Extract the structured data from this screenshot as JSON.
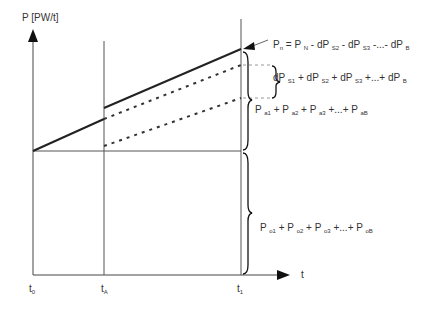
{
  "diagram": {
    "y_axis_label": "P [PW/t]",
    "x_axis_label": "t",
    "x_ticks": [
      {
        "main": "t",
        "sub": "0"
      },
      {
        "main": "t",
        "sub": "A"
      },
      {
        "main": "t",
        "sub": "1"
      }
    ],
    "labels": {
      "pn_formula": {
        "parts": [
          "P",
          "n",
          " = P ",
          "N",
          " - dP ",
          "S2",
          " - dP ",
          "S3",
          " -...- dP ",
          "B"
        ]
      },
      "dp_sum": {
        "parts": [
          "dP ",
          "S1",
          "  +  dP ",
          "S2",
          " + dP ",
          "S3",
          " +...+  dP ",
          "B"
        ]
      },
      "pa_sum": {
        "parts": [
          "P ",
          "a1",
          " + P ",
          "a2",
          " + P ",
          "a3",
          "  +...+  P ",
          "aB"
        ]
      },
      "po_sum": {
        "parts": [
          "P ",
          "o1",
          " + P ",
          "o2",
          " + P ",
          "o3",
          " +...+ P ",
          "oB"
        ]
      }
    },
    "lines": {
      "solid_upper": "P_n line (solid, from t_A to t_1)",
      "solid_lower": "baseline ramp (solid, from t_0 to t_A)",
      "dashed_upper": "dashed continuation from t_A to t_1",
      "dotted_lower": "dotted line from t_A to t_1"
    }
  }
}
